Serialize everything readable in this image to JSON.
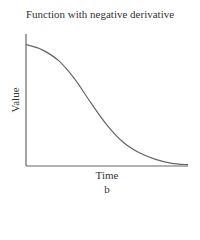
{
  "chart_data": {
    "type": "line",
    "title": "Function with negative derivative",
    "xlabel": "Time",
    "ylabel": "Value",
    "sublabel": "b",
    "grid": false,
    "ticks": false,
    "series": [
      {
        "name": "function",
        "description": "monotonically decreasing sigmoid-like curve",
        "x": [
          0,
          0.1,
          0.2,
          0.3,
          0.4,
          0.5,
          0.6,
          0.7,
          0.8,
          0.9,
          1.0
        ],
        "y": [
          0.92,
          0.88,
          0.8,
          0.66,
          0.48,
          0.31,
          0.18,
          0.1,
          0.05,
          0.02,
          0.01
        ]
      }
    ],
    "xlim": [
      0,
      1
    ],
    "ylim": [
      0,
      1
    ]
  }
}
